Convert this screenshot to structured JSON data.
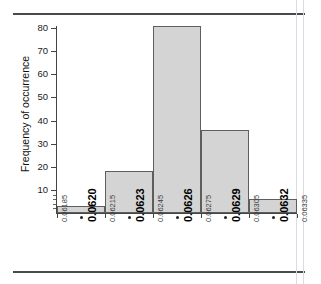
{
  "chart_data": {
    "type": "bar",
    "title": "",
    "xlabel": "",
    "ylabel": "Frequency of occurrence",
    "ylim": [
      0,
      85
    ],
    "yticks": [
      10,
      20,
      30,
      40,
      50,
      60,
      70,
      80
    ],
    "ytick_labels": [
      "10",
      "20",
      "30",
      "40",
      "50",
      "60",
      "70",
      "80"
    ],
    "grid": false,
    "legend": null,
    "bin_edges": [
      0.06185,
      0.06215,
      0.06245,
      0.06275,
      0.06305,
      0.06335
    ],
    "bin_edge_labels": [
      "0.06185",
      "0.06215",
      "0.06245",
      "0.06275",
      "0.06305",
      "0.06335"
    ],
    "bin_centers": [
      0.062,
      0.0623,
      0.0626,
      0.0629,
      0.0632
    ],
    "bin_center_labels": [
      "0.0620",
      "0.0623",
      "0.0626",
      "0.0629",
      "0.0632"
    ],
    "categories": [
      "0.0620",
      "0.0623",
      "0.0626",
      "0.0629",
      "0.0632"
    ],
    "values": [
      3,
      18,
      81,
      36,
      6
    ],
    "bar_fill_color": "#d4d4d4",
    "bar_edge_color": "#5e5e5e"
  },
  "axis": {
    "y_label": "Frequency of occurrence"
  },
  "bars": [
    {
      "label": "0.0620",
      "value": 3
    },
    {
      "label": "0.0623",
      "value": 18
    },
    {
      "label": "0.0626",
      "value": 81
    },
    {
      "label": "0.0629",
      "value": 36
    },
    {
      "label": "0.0632",
      "value": 6
    }
  ],
  "yticks": [
    {
      "label": "80",
      "value": 80
    },
    {
      "label": "70",
      "value": 70
    },
    {
      "label": "60",
      "value": 60
    },
    {
      "label": "50",
      "value": 50
    },
    {
      "label": "40",
      "value": 40
    },
    {
      "label": "30",
      "value": 30
    },
    {
      "label": "20",
      "value": 20
    },
    {
      "label": "10",
      "value": 10
    }
  ],
  "xlabels_minor": [
    {
      "label": "0.06185"
    },
    {
      "label": "0.06215"
    },
    {
      "label": "0.06245"
    },
    {
      "label": "0.06275"
    },
    {
      "label": "0.06305"
    },
    {
      "label": "0.06335"
    }
  ],
  "xlabels_major": [
    {
      "label": "0.0620"
    },
    {
      "label": "0.0623"
    },
    {
      "label": "0.0626"
    },
    {
      "label": "0.0629"
    },
    {
      "label": "0.0632"
    }
  ]
}
